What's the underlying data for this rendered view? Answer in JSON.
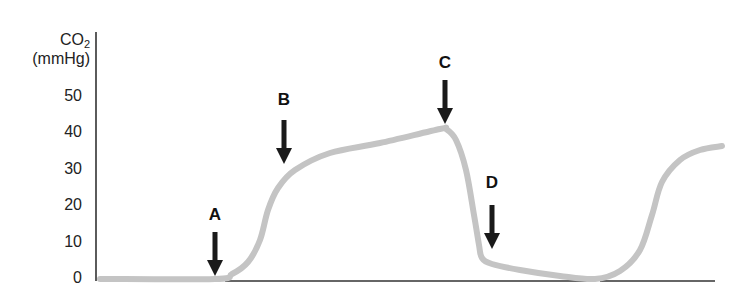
{
  "chart_data": {
    "type": "line",
    "title": "",
    "xlabel": "",
    "ylabel": "CO2 (mmHg)",
    "ylabel_line1": "CO",
    "ylabel_sub": "2",
    "ylabel_line2": "(mmHg)",
    "ylim": [
      0,
      55
    ],
    "yticks": [
      0,
      10,
      20,
      30,
      40,
      50
    ],
    "ytick_labels": [
      "0",
      "10",
      "20",
      "30",
      "40",
      "50"
    ],
    "grid": false,
    "legend": null,
    "series": [
      {
        "name": "Capnogram CO2 waveform",
        "color": "#c4c4c4",
        "points_px": [
          [
            100,
            279
          ],
          [
            215,
            279
          ],
          [
            232,
            274
          ],
          [
            248,
            262
          ],
          [
            260,
            240
          ],
          [
            268,
            210
          ],
          [
            278,
            188
          ],
          [
            295,
            170
          ],
          [
            330,
            153
          ],
          [
            380,
            143
          ],
          [
            440,
            129
          ],
          [
            446,
            129
          ],
          [
            456,
            140
          ],
          [
            466,
            170
          ],
          [
            474,
            215
          ],
          [
            479,
            245
          ],
          [
            482,
            258
          ],
          [
            492,
            264
          ],
          [
            520,
            270
          ],
          [
            560,
            276
          ],
          [
            595,
            279
          ],
          [
            620,
            271
          ],
          [
            640,
            250
          ],
          [
            652,
            215
          ],
          [
            662,
            182
          ],
          [
            680,
            160
          ],
          [
            700,
            150
          ],
          [
            722,
            146
          ]
        ],
        "approx_values": [
          {
            "phase": "baseline",
            "co2": 0
          },
          {
            "phase": "A (start of expiration)",
            "co2": 0
          },
          {
            "phase": "B (alveolar plateau begins)",
            "co2": 30
          },
          {
            "phase": "C (end-tidal peak)",
            "co2": 41
          },
          {
            "phase": "D (inspiration, drop)",
            "co2": 6
          },
          {
            "phase": "next cycle rise",
            "co2": 36
          }
        ]
      }
    ],
    "annotations": [
      {
        "label": "A",
        "x": 215,
        "label_y": 215,
        "arrow_top": 232,
        "arrow_bottom": 276
      },
      {
        "label": "B",
        "x": 284,
        "label_y": 100,
        "arrow_top": 120,
        "arrow_bottom": 164
      },
      {
        "label": "C",
        "x": 445,
        "label_y": 63,
        "arrow_top": 80,
        "arrow_bottom": 124
      },
      {
        "label": "D",
        "x": 492,
        "label_y": 183,
        "arrow_top": 205,
        "arrow_bottom": 249
      }
    ]
  },
  "axis": {
    "y_axis_x": 96,
    "y_axis_top": 32,
    "y_axis_bottom": 281,
    "zero_px": 279,
    "px_per_10": 36.5,
    "baseline_segments": [
      [
        225,
        590
      ],
      [
        600,
        715
      ]
    ]
  },
  "colors": {
    "curve": "#c4c4c4",
    "axis": "#333333",
    "arrow": "#1a1a1a",
    "text": "#222222"
  }
}
